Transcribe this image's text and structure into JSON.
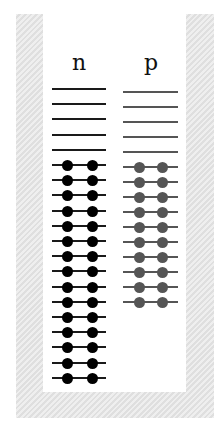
{
  "diagram": {
    "title": "",
    "columns": [
      {
        "label": "n",
        "empty_levels": 5,
        "filled_levels": 15,
        "electrons_per_level": 2,
        "line_color": "#1a1a1a",
        "dot_color": "#000000"
      },
      {
        "label": "p",
        "empty_levels": 5,
        "filled_levels": 10,
        "electrons_per_level": 2,
        "line_color": "#555555",
        "dot_color": "#555555"
      }
    ],
    "container_color": "#e6e6e6",
    "background_color": "#ffffff"
  }
}
